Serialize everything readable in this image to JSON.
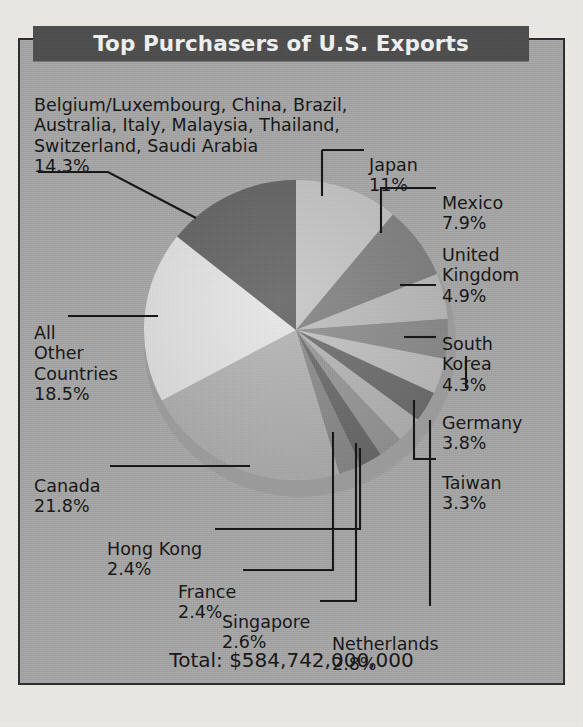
{
  "title": "Top Purchasers of U.S. Exports",
  "total_label": "Total: $584,742,000,000",
  "labels": {
    "group": "Belgium/Luxembourg, China, Brazil,\nAustralia, Italy, Malaysia, Thailand,\nSwitzerland, Saudi Arabia",
    "group_pct": "14.3%",
    "japan": "Japan",
    "japan_pct": "11%",
    "mexico": "Mexico",
    "mexico_pct": "7.9%",
    "uk": "United\nKingdom",
    "uk_pct": "4.9%",
    "korea": "South\nKorea",
    "korea_pct": "4.3%",
    "germany": "Germany",
    "germany_pct": "3.8%",
    "taiwan": "Taiwan",
    "taiwan_pct": "3.3%",
    "other": "All\nOther\nCountries",
    "other_pct": "18.5%",
    "canada": "Canada",
    "canada_pct": "21.8%",
    "hongkong": "Hong Kong",
    "hongkong_pct": "2.4%",
    "france": "France",
    "france_pct": "2.4%",
    "singapore": "Singapore",
    "singapore_pct": "2.6%",
    "netherlands": "Netherlands",
    "netherlands_pct": "2.8%"
  },
  "colors": {
    "panel_background": "#a9a9a9",
    "title_background": "#4d4d4d",
    "title_text": "#f2f2f2",
    "frame_border": "#2b2b2b",
    "page_background": "#eceae6",
    "text": "#151515"
  },
  "chart_data": {
    "type": "pie",
    "title": "Top Purchasers of U.S. Exports",
    "total": "$584,742,000,000",
    "units": "percent of U.S. exports",
    "legend": "none",
    "labels_mode": "leader-lines",
    "start_angle_deg": -90,
    "direction": "clockwise",
    "categories": [
      "Japan",
      "Mexico",
      "United Kingdom",
      "South Korea",
      "Germany",
      "Taiwan",
      "Netherlands",
      "Singapore",
      "France",
      "Hong Kong",
      "Canada",
      "All Other Countries",
      "Belgium/Luxembourg, China, Brazil, Australia, Italy, Malaysia, Thailand, Switzerland, Saudi Arabia"
    ],
    "values": [
      11,
      7.9,
      4.9,
      4.3,
      3.8,
      3.3,
      2.8,
      2.6,
      2.4,
      2.4,
      21.8,
      18.5,
      14.3
    ],
    "slice_colors": [
      "#c9c9c9",
      "#838383",
      "#c0c0c0",
      "#8f8f8f",
      "#c4c4c4",
      "#6f6f6f",
      "#b9b9b9",
      "#999999",
      "#6b6b6b",
      "#8c8c8c",
      "#b5b5b5",
      "#e8e8e8",
      "#636363"
    ]
  }
}
